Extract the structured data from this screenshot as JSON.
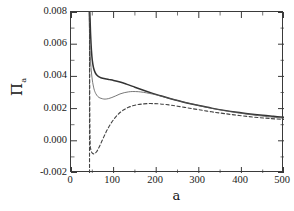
{
  "chart_data": {
    "type": "line",
    "title": "",
    "xlabel": "a",
    "ylabel": "Π",
    "ylabel_sub": "a",
    "ylabel_full": "Πa",
    "xlim": [
      0,
      500
    ],
    "ylim": [
      -0.002,
      0.008
    ],
    "xticks": [
      "0",
      "100",
      "200",
      "300",
      "400",
      "500"
    ],
    "xtick_values": [
      0,
      100,
      200,
      300,
      400,
      500
    ],
    "yticks": [
      "0.008",
      "0.006",
      "0.004",
      "0.002",
      "0.000",
      "-0.002"
    ],
    "ytick_values": [
      0.008,
      0.006,
      0.004,
      0.002,
      0.0,
      -0.002
    ],
    "xminor_interval": 50,
    "yminor_interval": 0.001,
    "grid": false,
    "legend": false,
    "tick_direction": "in",
    "frame": "box",
    "line_color": "#3a3a3a",
    "background": "#ffffff",
    "series": [
      {
        "name": "thick-solid",
        "style": "solid",
        "width": 1.5,
        "color": "#333333",
        "x": [
          44,
          45,
          46,
          48,
          50,
          53,
          56,
          60,
          65,
          70,
          80,
          90,
          100,
          115,
          130,
          150,
          170,
          190,
          210,
          230,
          250,
          275,
          300,
          330,
          360,
          390,
          420,
          450,
          475,
          500
        ],
        "y": [
          0.008,
          0.0074,
          0.0066,
          0.0056,
          0.005,
          0.00452,
          0.00428,
          0.0041,
          0.00398,
          0.00392,
          0.00385,
          0.0038,
          0.00375,
          0.00365,
          0.00352,
          0.00333,
          0.00314,
          0.00296,
          0.0028,
          0.00264,
          0.0025,
          0.00233,
          0.00219,
          0.00203,
          0.00189,
          0.00177,
          0.00167,
          0.00158,
          0.00152,
          0.00146
        ]
      },
      {
        "name": "thin-solid",
        "style": "solid",
        "width": 0.8,
        "color": "#555555",
        "x": [
          42,
          43,
          44,
          45,
          47,
          50,
          54,
          58,
          63,
          68,
          74,
          80,
          88,
          96,
          105,
          115,
          125,
          135,
          145,
          158,
          170,
          185,
          200,
          220,
          240,
          265,
          290,
          320,
          350,
          385,
          420,
          455,
          480,
          500
        ],
        "y": [
          0.008,
          0.0072,
          0.0062,
          0.0054,
          0.00455,
          0.00378,
          0.00322,
          0.00294,
          0.00275,
          0.00266,
          0.00261,
          0.00259,
          0.00262,
          0.00269,
          0.00279,
          0.00291,
          0.00299,
          0.00304,
          0.00306,
          0.00305,
          0.00301,
          0.00294,
          0.00285,
          0.00271,
          0.00257,
          0.0024,
          0.00225,
          0.00207,
          0.00192,
          0.00176,
          0.00163,
          0.00152,
          0.00145,
          0.0014
        ]
      },
      {
        "name": "dashed",
        "style": "dashed",
        "width": 1.1,
        "color": "#444444",
        "x": [
          43.5,
          43.6,
          43.8,
          44.2,
          45,
          46,
          47.5,
          49,
          51,
          53,
          55,
          57,
          60,
          63,
          67,
          72,
          78,
          85,
          93,
          102,
          112,
          123,
          135,
          150,
          165,
          180,
          195,
          210,
          230,
          250,
          275,
          300,
          330,
          360,
          395,
          430,
          465,
          500
        ],
        "y": [
          0.008,
          0.006,
          0.0035,
          0.0012,
          -0.0002,
          -0.00048,
          -0.00065,
          -0.00073,
          -0.00079,
          -0.00081,
          -0.0008,
          -0.00077,
          -0.00068,
          -0.00055,
          -0.00034,
          -5e-05,
          0.0003,
          0.00068,
          0.00105,
          0.00139,
          0.00168,
          0.00191,
          0.00208,
          0.00221,
          0.00228,
          0.00231,
          0.00231,
          0.00229,
          0.00223,
          0.00215,
          0.00204,
          0.00193,
          0.0018,
          0.00169,
          0.00157,
          0.00147,
          0.00139,
          0.00132
        ]
      },
      {
        "name": "dashed-asymptote",
        "style": "dashed",
        "width": 1.1,
        "color": "#444444",
        "vertical_at_x": 43.5,
        "x": [
          43.5,
          43.5
        ],
        "y": [
          -0.002,
          0.008
        ]
      }
    ]
  }
}
